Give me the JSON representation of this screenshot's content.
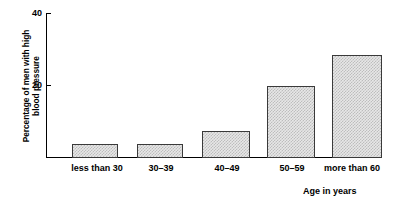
{
  "chart_data": {
    "type": "bar",
    "title": "",
    "subtitle": "",
    "xlabel": "Age in years",
    "ylabel": "Percentage of men with high blood pressure",
    "ylabel_lines": [
      "Percentage of men with high",
      "blood pressure"
    ],
    "categories": [
      "less than 30",
      "30–39",
      "40–49",
      "50–59",
      "more than 60"
    ],
    "values": [
      4,
      4,
      7.5,
      20,
      28.5
    ],
    "ylim": [
      0,
      40
    ],
    "yticks": [
      20,
      40
    ],
    "ytick_labels": [
      "20",
      "40"
    ],
    "grid": false,
    "legend": false,
    "legend_position": "none",
    "bar_fill_color": "#e7e7e7",
    "bar_border_color": "#3a3a3a",
    "axis_color": "#000000",
    "background_color": "#ffffff"
  }
}
